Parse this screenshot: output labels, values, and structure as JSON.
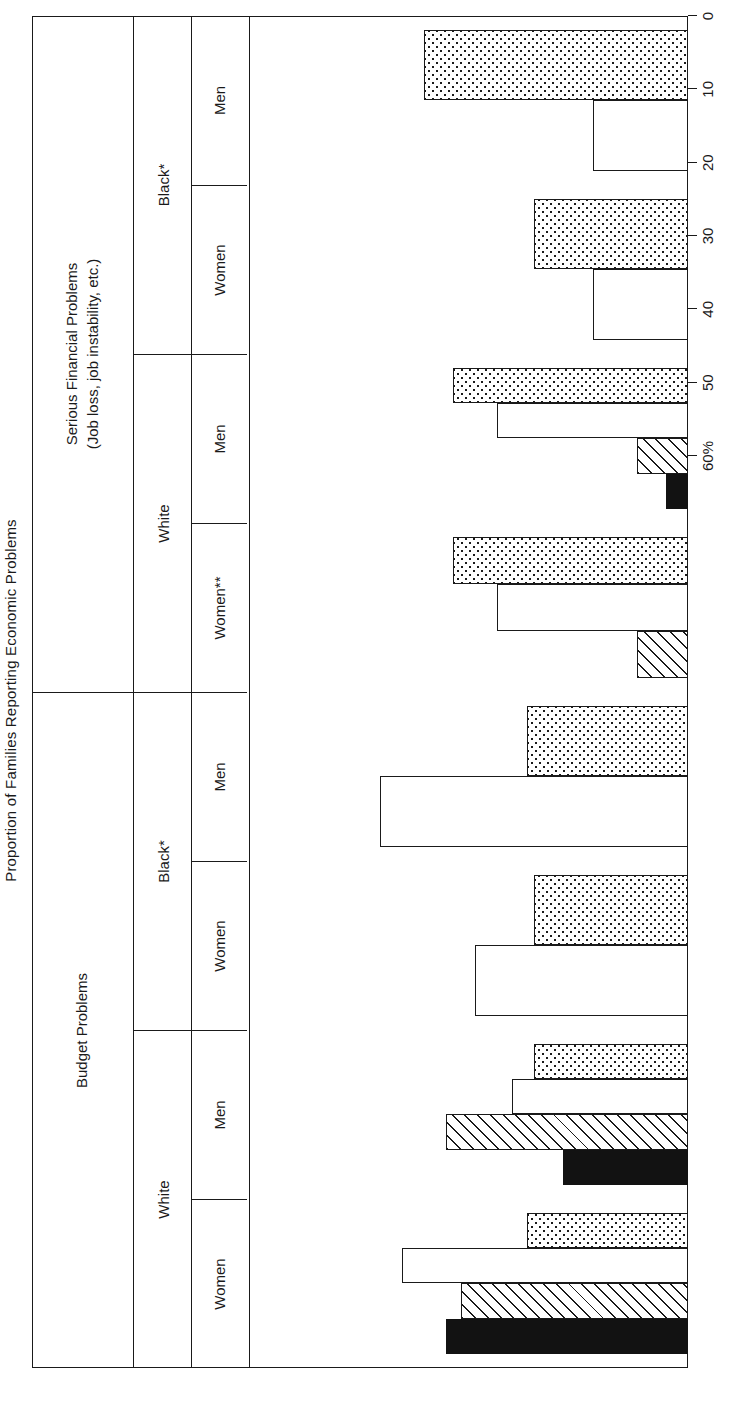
{
  "figure": {
    "title": "Proportion of Families Reporting Economic Problems"
  },
  "sections": [
    {
      "label": "Budget Problems",
      "sublabel": ""
    },
    {
      "label": "Serious Financial Problems",
      "sublabel": "(Job loss, job instability, etc.)"
    }
  ],
  "race_groups": [
    "White",
    "Black*",
    "White",
    "Black*"
  ],
  "sex_groups": [
    "Women",
    "Men",
    "Women",
    "Men",
    "Women**",
    "Men",
    "Women",
    "Men"
  ],
  "axis": {
    "ticks": [
      "60%",
      "50",
      "40",
      "30",
      "20",
      "10",
      "0"
    ],
    "tick_values": [
      60,
      50,
      40,
      30,
      20,
      10,
      0
    ],
    "min": 0,
    "max": 60,
    "unit": "%"
  },
  "legend": [
    {
      "key": "upper_middle",
      "label": "Upper-middle class",
      "pattern": "solid-black",
      "color": "#121212"
    },
    {
      "key": "lower_middle",
      "label": "Lower-middle class",
      "pattern": "diagonal-hatch",
      "color": "#ffffff"
    },
    {
      "key": "upper_lower",
      "label": "Upper-lower class",
      "pattern": "empty-white",
      "color": "#ffffff"
    },
    {
      "key": "lower_lower",
      "label": "Lower-lower class",
      "pattern": "dotted",
      "color": "#ffffff"
    }
  ],
  "footnotes": {
    "single_star": "*",
    "double_star": "**"
  },
  "chart_data": {
    "type": "bar",
    "orientation": "horizontal",
    "title": "Proportion of Families Reporting Economic Problems",
    "xlabel": "",
    "ylabel": "",
    "xlim": [
      0,
      60
    ],
    "grid": false,
    "legend_position": "bottom-right",
    "panels": [
      {
        "name": "Budget Problems",
        "groups": [
          {
            "race": "White",
            "sex": "Women",
            "values": {
              "upper_middle": 33,
              "lower_middle": 31,
              "upper_lower": 39,
              "lower_lower": 22
            }
          },
          {
            "race": "White",
            "sex": "Men",
            "values": {
              "upper_middle": 17,
              "lower_middle": 33,
              "upper_lower": 24,
              "lower_lower": 21
            }
          },
          {
            "race": "Black*",
            "sex": "Women",
            "values": {
              "upper_middle": null,
              "lower_middle": null,
              "upper_lower": 29,
              "lower_lower": 21
            }
          },
          {
            "race": "Black*",
            "sex": "Men",
            "values": {
              "upper_middle": null,
              "lower_middle": null,
              "upper_lower": 42,
              "lower_lower": 22
            }
          }
        ]
      },
      {
        "name": "Serious Financial Problems (Job loss, job instability, etc.)",
        "groups": [
          {
            "race": "White",
            "sex": "Women**",
            "values": {
              "upper_middle": null,
              "lower_middle": 7,
              "upper_lower": 26,
              "lower_lower": 32
            }
          },
          {
            "race": "White",
            "sex": "Men",
            "values": {
              "upper_middle": 3,
              "lower_middle": 7,
              "upper_lower": 26,
              "lower_lower": 32
            }
          },
          {
            "race": "Black*",
            "sex": "Women",
            "values": {
              "upper_middle": null,
              "lower_middle": null,
              "upper_lower": 13,
              "lower_lower": 21
            }
          },
          {
            "race": "Black*",
            "sex": "Men",
            "values": {
              "upper_middle": null,
              "lower_middle": null,
              "upper_lower": 13,
              "lower_lower": 36
            }
          }
        ]
      }
    ],
    "series_order": [
      "upper_middle",
      "lower_middle",
      "upper_lower",
      "lower_lower"
    ]
  }
}
